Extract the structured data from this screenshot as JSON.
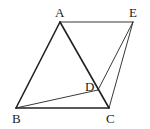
{
  "figure": {
    "points": {
      "A": {
        "label": "A",
        "x": 60,
        "y": 22
      },
      "E": {
        "label": "E",
        "x": 133,
        "y": 22
      },
      "B": {
        "label": "B",
        "x": 16,
        "y": 108
      },
      "C": {
        "label": "C",
        "x": 109,
        "y": 108
      },
      "D": {
        "label": "D",
        "x": 98,
        "y": 90
      }
    },
    "segments": [
      {
        "from": "A",
        "to": "B",
        "weight": "thick"
      },
      {
        "from": "A",
        "to": "C",
        "weight": "thick"
      },
      {
        "from": "B",
        "to": "C",
        "weight": "thick"
      },
      {
        "from": "A",
        "to": "E",
        "weight": "thin"
      },
      {
        "from": "E",
        "to": "C",
        "weight": "thin"
      },
      {
        "from": "E",
        "to": "D",
        "weight": "thin"
      },
      {
        "from": "B",
        "to": "D",
        "weight": "thin"
      }
    ],
    "stroke_color": "#222222"
  }
}
